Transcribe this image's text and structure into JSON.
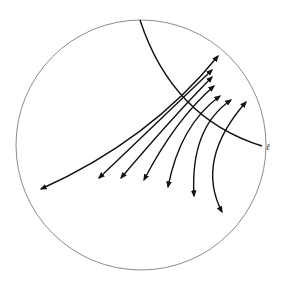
{
  "diagram": {
    "type": "hyperbolic-disk",
    "boundary_circle": {
      "cx": 141,
      "cy": 145,
      "r": 125,
      "color": "#8c8c8c"
    },
    "geodesic": {
      "label": "ℓ",
      "path": "M 140 20 Q 172 118 262 146",
      "color": "#111111"
    },
    "flow_lines": [
      {
        "path": "M 41 189 Q 150 140 218 56"
      },
      {
        "path": "M 99 178 Q 160 120 212 70"
      },
      {
        "path": "M 121 178 Q 170 120 212 77"
      },
      {
        "path": "M 144 180 Q 175 120 214 86"
      },
      {
        "path": "M 168 187 Q 180 125 220 96"
      },
      {
        "path": "M 194 196 Q 190 128 231 100"
      },
      {
        "path": "M 222 212 Q 195 160 246 102"
      }
    ],
    "arrow_color": "#111111"
  }
}
